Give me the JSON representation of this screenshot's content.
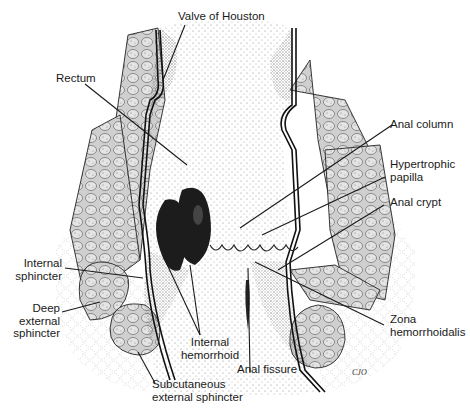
{
  "figure": {
    "signature": "CJO",
    "colors": {
      "ink": "#1a1a1a",
      "background": "#ffffff",
      "muscle_fill": "#d8d8d8",
      "hemorrhoid_fill": "#1c1c1c",
      "stipple": "#9a9a9a"
    }
  },
  "labels": {
    "valve_of_houston": "Valve of Houston",
    "rectum": "Rectum",
    "anal_column": "Anal column",
    "hypertrophic_papilla_1": "Hypertrophic",
    "hypertrophic_papilla_2": "papilla",
    "anal_crypt": "Anal crypt",
    "internal_sphincter_1": "Internal",
    "internal_sphincter_2": "sphincter",
    "deep_external_sphincter_1": "Deep",
    "deep_external_sphincter_2": "external",
    "deep_external_sphincter_3": "sphincter",
    "internal_hemorrhoid_1": "Internal",
    "internal_hemorrhoid_2": "hemorrhoid",
    "zona_hemorrhoidalis_1": "Zona",
    "zona_hemorrhoidalis_2": "hemorrhoidalis",
    "anal_fissure": "Anal fissure",
    "subcutaneous_external_sphincter_1": "Subcutaneous",
    "subcutaneous_external_sphincter_2": "external sphincter"
  }
}
